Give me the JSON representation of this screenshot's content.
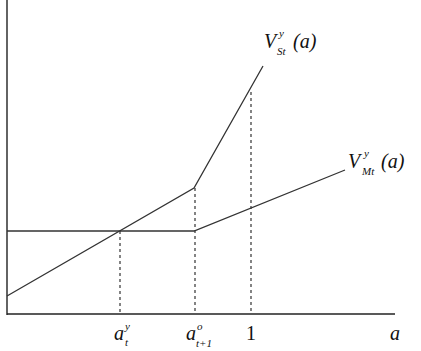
{
  "diagram": {
    "type": "piecewise-linear value functions",
    "axes": {
      "x_label": "a",
      "y_label": ""
    },
    "curves": [
      {
        "name": "V_St^y(a)",
        "label_main": "V",
        "label_sup": "y",
        "label_sub": "St",
        "label_arg": "(a)",
        "description": "Rising line, kinks upward at a_{t+1}^o"
      },
      {
        "name": "V_Mt^y(a)",
        "label_main": "V",
        "label_sup": "y",
        "label_sub": "Mt",
        "label_arg": "(a)",
        "description": "Flat until a_{t+1}^o, then rising"
      }
    ],
    "x_ticks": [
      {
        "main": "a",
        "sup": "y",
        "sub": "t"
      },
      {
        "main": "a",
        "sup": "o",
        "sub": "t+1"
      },
      {
        "main": "1",
        "sup": "",
        "sub": ""
      }
    ],
    "guides": "dashed vertical lines at each x tick"
  }
}
